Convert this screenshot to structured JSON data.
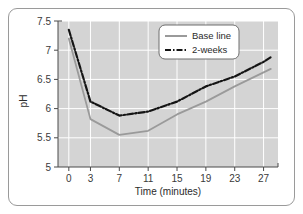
{
  "chart_data": {
    "type": "line",
    "title": "",
    "xlabel": "Time (minutes)",
    "ylabel": "pH",
    "xlim": [
      -1.5,
      29
    ],
    "ylim": [
      5,
      7.5
    ],
    "xticks": [
      0,
      3,
      7,
      11,
      15,
      19,
      23,
      27
    ],
    "xtick_labels": [
      "0",
      "3",
      "7",
      "11",
      "15",
      "19",
      "23",
      "27"
    ],
    "yticks": [
      5,
      5.5,
      6,
      6.5,
      7,
      7.5
    ],
    "ytick_labels": [
      "5",
      "5.5",
      "6",
      "6.5",
      "7",
      "7.5"
    ],
    "grid": true,
    "grid_color": "#ffffff",
    "plot_background": "#d4d4d4",
    "legend_position": "top-right",
    "x": [
      0,
      3,
      7,
      11,
      15,
      19,
      23,
      27,
      28
    ],
    "series": [
      {
        "name": "Base line",
        "color": "#9a9a9a",
        "linestyle": "solid",
        "values": [
          7.2,
          5.82,
          5.55,
          5.62,
          5.9,
          6.12,
          6.38,
          6.62,
          6.68
        ]
      },
      {
        "name": "2-weeks",
        "color": "#151515",
        "linestyle": "dashdot",
        "values": [
          7.35,
          6.12,
          5.88,
          5.95,
          6.12,
          6.38,
          6.55,
          6.8,
          6.88
        ]
      }
    ]
  },
  "legend": {
    "entries": [
      {
        "label": "Base line"
      },
      {
        "label": "2-weeks"
      }
    ]
  },
  "axes": {
    "x_title": "Time (minutes)",
    "y_title": "pH"
  }
}
